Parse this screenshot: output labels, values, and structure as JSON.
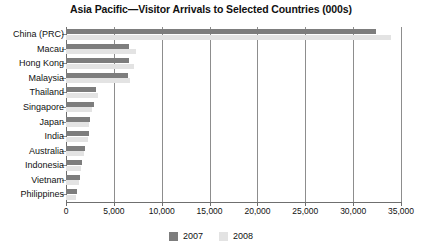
{
  "chart_data": {
    "type": "bar",
    "orientation": "horizontal",
    "title": "Asia Pacific—Visitor Arrivals to Selected Countries (000s)",
    "xlabel": "",
    "ylabel": "",
    "xlim": [
      0,
      35000
    ],
    "grid": true,
    "legend_position": "bottom",
    "xticks": [
      0,
      5000,
      10000,
      15000,
      20000,
      25000,
      30000,
      35000
    ],
    "xtick_labels": [
      "0",
      "5,000",
      "10,000",
      "15,000",
      "20,000",
      "25,000",
      "30,000",
      "35,000"
    ],
    "categories": [
      "China (PRC)",
      "Macau",
      "Hong Kong",
      "Malaysia",
      "Thailand",
      "Singapore",
      "Japan",
      "India",
      "Australia",
      "Indonesia",
      "Vietnam",
      "Philippines"
    ],
    "series": [
      {
        "name": "2007",
        "color": "#7d7d7d",
        "values": [
          32400,
          6600,
          6550,
          6500,
          3150,
          2900,
          2550,
          2400,
          1950,
          1700,
          1500,
          1100
        ]
      },
      {
        "name": "2008",
        "color": "#e3e3e3",
        "values": [
          34000,
          7350,
          7100,
          6700,
          3350,
          2750,
          2400,
          2250,
          1850,
          1600,
          1400,
          1000
        ]
      }
    ]
  },
  "legend": {
    "items": [
      {
        "label": "2007",
        "color": "#7d7d7d"
      },
      {
        "label": "2008",
        "color": "#e3e3e3"
      }
    ]
  }
}
